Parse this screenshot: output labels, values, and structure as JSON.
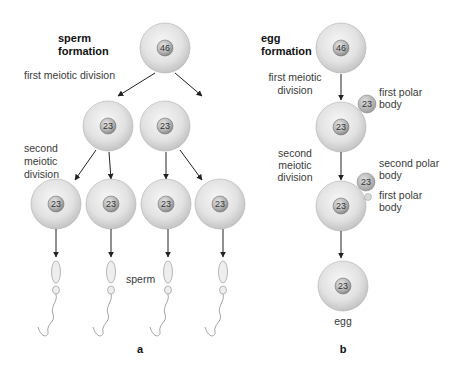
{
  "panel_a": {
    "title_line1": "sperm",
    "title_line2": "formation",
    "first_division": "first meiotic division",
    "second_division_line1": "second",
    "second_division_line2": "meiotic",
    "second_division_line3": "division",
    "parent_chromosomes": "46",
    "secondary_chromosomes": [
      "23",
      "23"
    ],
    "spermatid_chromosomes": [
      "23",
      "23",
      "23",
      "23"
    ],
    "sperm_label": "sperm",
    "panel_label": "a"
  },
  "panel_b": {
    "title_line1": "egg",
    "title_line2": "formation",
    "first_division_line1": "first meiotic",
    "first_division_line2": "division",
    "second_division_line1": "second",
    "second_division_line2": "meiotic",
    "second_division_line3": "division",
    "parent_chromosomes": "46",
    "secondary_chromosomes": "23",
    "first_polar_body_chromosomes": "23",
    "first_polar_label_line1": "first polar",
    "first_polar_label_line2": "body",
    "ootid_chromosomes": "23",
    "second_polar_body_chromosomes": "23",
    "second_polar_label_line1": "second polar",
    "second_polar_label_line2": "body",
    "first_polar_label2_line1": "first polar",
    "first_polar_label2_line2": "body",
    "egg_chromosomes": "23",
    "egg_label": "egg",
    "panel_label": "b"
  },
  "colors": {
    "cell_light": "#f2f2f2",
    "cell_dark": "#c4c4c4",
    "nucleus_light": "#d9d9d9",
    "nucleus_dark": "#8f8f8f",
    "arrow": "#222222"
  }
}
